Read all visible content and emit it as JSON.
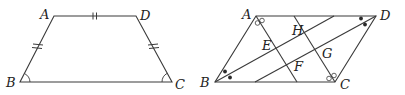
{
  "figures": [
    {
      "id": "trapezoid",
      "shape": "isosceles trapezoid",
      "vertices": {
        "A": {
          "label": "A",
          "x": 54,
          "y": 16
        },
        "D": {
          "label": "D",
          "x": 136,
          "y": 16
        },
        "B": {
          "label": "B",
          "x": 20,
          "y": 82
        },
        "C": {
          "label": "C",
          "x": 172,
          "y": 82
        }
      },
      "equal_segments": [
        "AD",
        "AB",
        "DC"
      ],
      "equal_angles": [
        "B",
        "C"
      ]
    },
    {
      "id": "parallelogram",
      "shape": "parallelogram with angle bisectors",
      "vertices": {
        "A": {
          "label": "A",
          "x": 256,
          "y": 16
        },
        "D": {
          "label": "D",
          "x": 376,
          "y": 16
        },
        "B": {
          "label": "B",
          "x": 215,
          "y": 82
        },
        "C": {
          "label": "C",
          "x": 335,
          "y": 82
        }
      },
      "bisectors": [
        {
          "from": "A",
          "to_x": 297,
          "to_y": 82,
          "mark": "double-ring"
        },
        {
          "from": "C",
          "to_x": 294,
          "to_y": 16,
          "mark": "double-ring"
        },
        {
          "from": "B",
          "to_x": 334,
          "to_y": 16,
          "mark": "double-dot"
        },
        {
          "from": "D",
          "to_x": 255,
          "to_y": 82,
          "mark": "double-dot"
        }
      ],
      "intersection_labels": {
        "E": "E",
        "F": "F",
        "G": "G",
        "H": "H"
      }
    }
  ],
  "colors": {
    "stroke": "#3a3a3a",
    "background": "#ffffff"
  }
}
